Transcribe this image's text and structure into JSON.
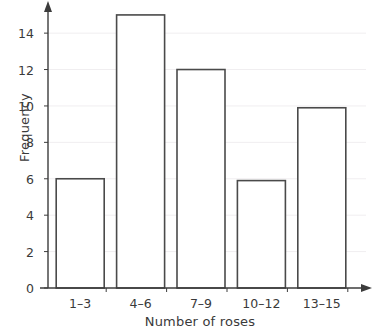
{
  "chart_data": {
    "type": "bar",
    "title": "",
    "subtitle": "",
    "xlabel": "Number of roses",
    "ylabel": "Frequency",
    "categories": [
      "1–3",
      "4–6",
      "7–9",
      "10–12",
      "13–15"
    ],
    "values": [
      6,
      15,
      12,
      5.9,
      9.9
    ],
    "ylim": [
      0,
      15.6
    ],
    "yticks": [
      0,
      2,
      4,
      6,
      8,
      10,
      12,
      14
    ],
    "ytick_labels": [
      "0",
      "2",
      "4",
      "6",
      "8",
      "10",
      "12",
      "14"
    ],
    "grid": "horizontal-faint",
    "legend": "none",
    "bar_fill": "#ffffff",
    "bar_stroke": "#4a4a4a",
    "axis_color": "#3c3c3c",
    "grid_color": "#f0eef0",
    "text_color": "#3a3a3a",
    "axis_arrows": true
  }
}
